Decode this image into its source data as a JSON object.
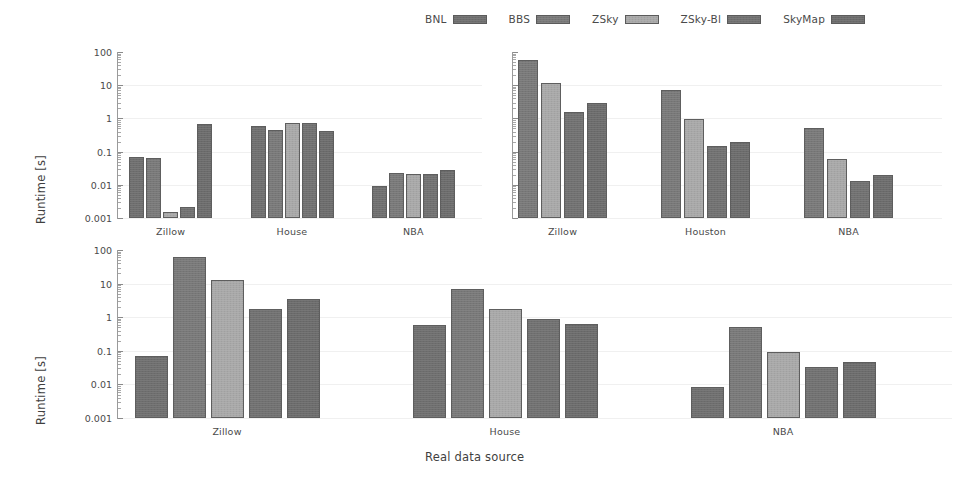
{
  "figure": {
    "xlabel": "Real data source",
    "ylabel": "Runtime [s]"
  },
  "legend": {
    "entries": [
      {
        "label": "BNL",
        "color": "#6e6e6e"
      },
      {
        "label": "BBS",
        "color": "#787878"
      },
      {
        "label": "ZSky",
        "color": "#a8a8a8"
      },
      {
        "label": "ZSky-Bl",
        "color": "#707070"
      },
      {
        "label": "SkyMap",
        "color": "#6b6b6b"
      }
    ]
  },
  "chart_data": [
    {
      "type": "bar",
      "title": "Skyline",
      "xlabel": "",
      "ylabel": "Runtime [s]",
      "yscale": "log",
      "ylim": [
        0.001,
        100
      ],
      "yticks": [
        "100",
        "10",
        "1",
        "0.1",
        "0.01",
        "0.001"
      ],
      "grid": true,
      "legend_position": "figure-top-center",
      "categories": [
        "Zillow",
        "House",
        "NBA"
      ],
      "series": [
        {
          "name": "BNL",
          "values": [
            0.07,
            0.6,
            0.0091
          ]
        },
        {
          "name": "BBS",
          "values": [
            0.064,
            0.46,
            0.022
          ]
        },
        {
          "name": "ZSky",
          "values": [
            0.0015,
            0.73,
            0.021
          ]
        },
        {
          "name": "ZSky-Bl",
          "values": [
            0.0021,
            0.75,
            0.021
          ]
        },
        {
          "name": "SkyMap",
          "values": [
            0.7,
            0.42,
            0.027
          ]
        }
      ]
    },
    {
      "type": "bar",
      "title": "Index",
      "xlabel": "",
      "ylabel": "",
      "yscale": "log",
      "ylim": [
        0.001,
        100
      ],
      "yticks": [
        "100",
        "10",
        "1",
        "0.1",
        "0.01",
        "0.001"
      ],
      "grid": true,
      "legend_position": "figure-top-center",
      "categories": [
        "Zillow",
        "Houston",
        "NBA"
      ],
      "series": [
        {
          "name": "BBS",
          "values": [
            58.0,
            7.0,
            0.5
          ]
        },
        {
          "name": "ZSky",
          "values": [
            12.0,
            0.95,
            0.061
          ]
        },
        {
          "name": "ZSky-Bl",
          "values": [
            1.6,
            0.145,
            0.0128
          ]
        },
        {
          "name": "SkyMap",
          "values": [
            3.0,
            0.2,
            0.02
          ]
        }
      ]
    },
    {
      "type": "bar",
      "title": "Skyline + Index",
      "xlabel": "Real data source",
      "ylabel": "Runtime [s]",
      "yscale": "log",
      "ylim": [
        0.001,
        100
      ],
      "yticks": [
        "100",
        "10",
        "1",
        "0.1",
        "0.01",
        "0.001"
      ],
      "grid": true,
      "legend_position": "figure-top-center",
      "categories": [
        "Zillow",
        "House",
        "NBA"
      ],
      "series": [
        {
          "name": "BNL",
          "values": [
            0.072,
            0.6,
            0.0085
          ]
        },
        {
          "name": "BBS",
          "values": [
            62.0,
            7.0,
            0.5
          ]
        },
        {
          "name": "ZSky",
          "values": [
            13.0,
            1.7,
            0.09
          ]
        },
        {
          "name": "ZSky-Bl",
          "values": [
            1.7,
            0.9,
            0.033
          ]
        },
        {
          "name": "SkyMap",
          "values": [
            3.5,
            0.65,
            0.046
          ]
        }
      ]
    }
  ]
}
